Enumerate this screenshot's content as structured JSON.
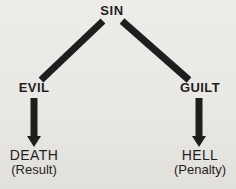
{
  "diagram": {
    "root": {
      "label": "SIN"
    },
    "branches": [
      {
        "label": "EVIL",
        "outcome": {
          "label": "DEATH",
          "sublabel": "(Result)"
        }
      },
      {
        "label": "GUILT",
        "outcome": {
          "label": "HELL",
          "sublabel": "(Penalty)"
        }
      }
    ],
    "edges": [
      {
        "from": "SIN",
        "to": "EVIL",
        "style": "thick-line"
      },
      {
        "from": "SIN",
        "to": "GUILT",
        "style": "thick-line"
      },
      {
        "from": "EVIL",
        "to": "DEATH",
        "style": "thick-arrow-down"
      },
      {
        "from": "GUILT",
        "to": "HELL",
        "style": "thick-arrow-down"
      }
    ],
    "colors": {
      "ink": "#1e1e1e",
      "background": "#e9e8e4"
    }
  }
}
